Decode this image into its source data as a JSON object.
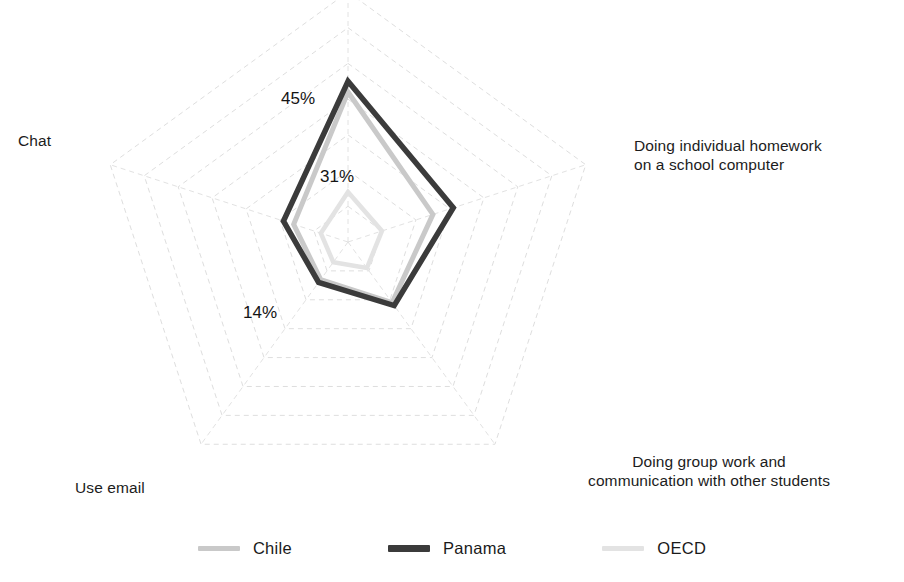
{
  "chart_data": {
    "type": "radar",
    "title": "",
    "categories": [
      "",
      "Doing individual homework\non a school computer",
      "Doing group work and\ncommunication with other students",
      "Use email",
      "Chat"
    ],
    "axis_angles_deg": [
      -90,
      -18,
      54,
      126,
      198
    ],
    "rings": 7,
    "ring_step_pct": 10,
    "rlim": [
      0,
      70
    ],
    "grid": "dashed",
    "legend_position": "bottom",
    "series": [
      {
        "name": "Chile",
        "color": "#c9c9c9",
        "values": [
          42,
          25,
          21,
          13,
          16
        ]
      },
      {
        "name": "Panama",
        "color": "#3b3b3b",
        "values": [
          45,
          31,
          22,
          14,
          19
        ]
      },
      {
        "name": "OECD",
        "color": "#e3e3e3",
        "values": [
          14,
          10,
          9,
          7,
          8
        ]
      }
    ],
    "annotations": [
      {
        "text": "45%",
        "series": "Panama",
        "axis": 0
      },
      {
        "text": "31%",
        "series": "Panama",
        "axis": 1
      },
      {
        "text": "14%",
        "series": "Panama",
        "axis": 3
      }
    ]
  },
  "axis_labels": {
    "top": "",
    "upper_right": "Doing individual homework\non a school computer",
    "lower_right": "Doing group work and\ncommunication with other students",
    "lower_left": "Use email",
    "upper_left": "Chat"
  },
  "value_labels": {
    "top": "45%",
    "upper_right": "31%",
    "lower_left": "14%"
  },
  "legend": {
    "items": [
      {
        "label": "Chile",
        "color": "#c9c9c9"
      },
      {
        "label": "Panama",
        "color": "#3b3b3b"
      },
      {
        "label": "OECD",
        "color": "#e3e3e3"
      }
    ]
  },
  "colors": {
    "grid": "#dedede",
    "spoke": "#e2e2e2",
    "background": "#ffffff",
    "text": "#1a1a1a"
  }
}
